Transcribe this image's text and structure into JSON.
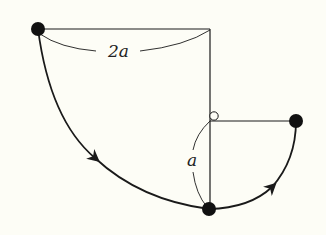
{
  "diagram": {
    "labels": {
      "horizontal_length": "2a",
      "lower_length": "a"
    },
    "points": {
      "start_bob": {
        "x": 38,
        "y": 29
      },
      "pivot": {
        "x": 210,
        "y": 29
      },
      "peg": {
        "x": 213,
        "y": 117
      },
      "bottom_bob": {
        "x": 209,
        "y": 209
      },
      "end_bob": {
        "x": 296,
        "y": 121
      }
    },
    "colors": {
      "background": "#fdfdf6",
      "ink": "#1a1a1a"
    }
  }
}
